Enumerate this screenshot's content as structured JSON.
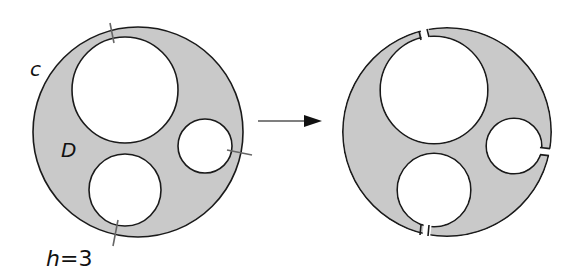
{
  "figure": {
    "labels": {
      "curve": "c",
      "region": "D",
      "h_var": "h",
      "h_eq": "=3"
    },
    "colors": {
      "region_fill": "#c9c9c9",
      "stroke": "#1a1a1a",
      "cut_stroke": "#666666",
      "arrow": "#111111"
    },
    "left_panel": {
      "description": "Disk with three holes; three cut segments marked",
      "outer_circle": {
        "cx": 138,
        "cy": 132,
        "r": 105
      },
      "holes": [
        {
          "name": "large-hole",
          "cx": 125,
          "cy": 90,
          "r": 53
        },
        {
          "name": "right-hole",
          "cx": 205,
          "cy": 146,
          "r": 27
        },
        {
          "name": "bottom-hole",
          "cx": 125,
          "cy": 190,
          "r": 36
        }
      ],
      "cut_count": 3
    },
    "right_panel": {
      "description": "Same region after cutting along the three segments"
    }
  }
}
